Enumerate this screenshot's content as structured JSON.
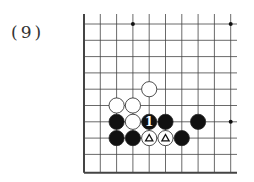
{
  "problem_label": "(9)",
  "board": {
    "origin_x": 84,
    "origin_y": 24,
    "spacing": 16.3,
    "cols": 10,
    "rows": 10,
    "right_edge_x": 237,
    "left_edge": true,
    "bottom_edge": true,
    "star_points": [
      [
        3,
        0
      ],
      [
        9,
        0
      ],
      [
        9,
        6
      ]
    ]
  },
  "stones": [
    {
      "color": "white",
      "col": 4,
      "row": 4,
      "mark": ""
    },
    {
      "color": "white",
      "col": 2,
      "row": 5,
      "mark": ""
    },
    {
      "color": "white",
      "col": 3,
      "row": 5,
      "mark": ""
    },
    {
      "color": "black",
      "col": 2,
      "row": 6,
      "mark": ""
    },
    {
      "color": "white",
      "col": 3,
      "row": 6,
      "mark": ""
    },
    {
      "color": "black",
      "col": 4,
      "row": 6,
      "mark": "1"
    },
    {
      "color": "black",
      "col": 5,
      "row": 6,
      "mark": ""
    },
    {
      "color": "black",
      "col": 7,
      "row": 6,
      "mark": ""
    },
    {
      "color": "black",
      "col": 2,
      "row": 7,
      "mark": ""
    },
    {
      "color": "black",
      "col": 3,
      "row": 7,
      "mark": ""
    },
    {
      "color": "white",
      "col": 4,
      "row": 7,
      "mark": "triangle"
    },
    {
      "color": "white",
      "col": 5,
      "row": 7,
      "mark": "triangle"
    },
    {
      "color": "black",
      "col": 6,
      "row": 7,
      "mark": ""
    }
  ]
}
